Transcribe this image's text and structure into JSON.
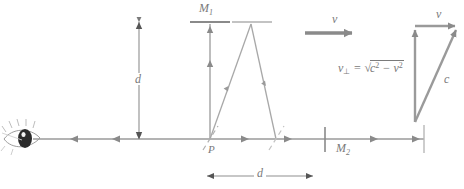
{
  "figure": {
    "colors": {
      "line": "#9a9a9a",
      "line_light": "#c0c0c0",
      "dark_arrow": "#808080",
      "text": "#7a7a7a",
      "background": "#ffffff",
      "pupil": "#1a1a1a"
    }
  },
  "labels": {
    "mirror1": "M",
    "mirror1_sub": "1",
    "mirror2": "M",
    "mirror2_sub": "2",
    "point_p": "P",
    "distance_vertical": "d",
    "distance_horizontal": "d",
    "velocity_arrow": "v",
    "velocity_top": "v",
    "speed_of_light": "c"
  },
  "formula": {
    "lhs": "v",
    "lhs_sub": "⊥",
    "equals": "=",
    "radical": "√",
    "radicand_a": "c",
    "radicand_a_exp": "2",
    "minus": "−",
    "radicand_b": "v",
    "radicand_b_exp": "2",
    "plain": "v⊥ = √(c² − v²)"
  },
  "elements": {
    "eye": "observer-eye",
    "beam_splitter": "beam-splitter-at-P",
    "second_splitter": "secondary-splitter",
    "horizontal_beam": "horizontal-light-beam",
    "vertical_beam": "vertical-light-beam-to-M1",
    "diagonal_path": "diagonal-light-path",
    "velocity_triangle": "velocity-vector-triangle"
  }
}
